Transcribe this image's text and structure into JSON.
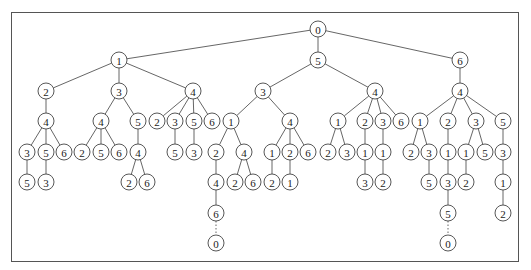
{
  "diagram": {
    "type": "tree",
    "radius": 8,
    "nodes": [
      {
        "id": "r",
        "label": "0",
        "x": 318,
        "y": 29
      },
      {
        "id": "a",
        "label": "1",
        "x": 119,
        "y": 60,
        "parent": "r"
      },
      {
        "id": "b",
        "label": "5",
        "x": 318,
        "y": 60,
        "parent": "r"
      },
      {
        "id": "c",
        "label": "6",
        "x": 460,
        "y": 60,
        "parent": "r"
      },
      {
        "id": "a1",
        "label": "2",
        "x": 46,
        "y": 91,
        "parent": "a"
      },
      {
        "id": "a2",
        "label": "3",
        "x": 119,
        "y": 91,
        "parent": "a"
      },
      {
        "id": "a3",
        "label": "4",
        "x": 193,
        "y": 91,
        "parent": "a"
      },
      {
        "id": "b1",
        "label": "3",
        "x": 263,
        "y": 91,
        "parent": "b"
      },
      {
        "id": "b2",
        "label": "4",
        "x": 375,
        "y": 91,
        "parent": "b"
      },
      {
        "id": "c1",
        "label": "4",
        "x": 460,
        "y": 91,
        "parent": "c"
      },
      {
        "id": "a1a",
        "label": "4",
        "x": 46,
        "y": 121,
        "parent": "a1"
      },
      {
        "id": "a2a",
        "label": "4",
        "x": 101,
        "y": 121,
        "parent": "a2"
      },
      {
        "id": "a2b",
        "label": "5",
        "x": 138,
        "y": 121,
        "parent": "a2"
      },
      {
        "id": "a3a",
        "label": "2",
        "x": 157,
        "y": 121,
        "parent": "a3"
      },
      {
        "id": "a3b",
        "label": "3",
        "x": 175,
        "y": 121,
        "parent": "a3"
      },
      {
        "id": "a3c",
        "label": "5",
        "x": 194,
        "y": 121,
        "parent": "a3"
      },
      {
        "id": "a3d",
        "label": "6",
        "x": 212,
        "y": 121,
        "parent": "a3"
      },
      {
        "id": "b1a",
        "label": "1",
        "x": 231,
        "y": 121,
        "parent": "b1"
      },
      {
        "id": "b1b",
        "label": "4",
        "x": 290,
        "y": 121,
        "parent": "b1"
      },
      {
        "id": "b2a",
        "label": "1",
        "x": 338,
        "y": 121,
        "parent": "b2"
      },
      {
        "id": "b2b",
        "label": "2",
        "x": 365,
        "y": 121,
        "parent": "b2"
      },
      {
        "id": "b2c",
        "label": "3",
        "x": 383,
        "y": 121,
        "parent": "b2"
      },
      {
        "id": "b2d",
        "label": "6",
        "x": 401,
        "y": 121,
        "parent": "b2"
      },
      {
        "id": "c1a",
        "label": "1",
        "x": 420,
        "y": 121,
        "parent": "c1"
      },
      {
        "id": "c1b",
        "label": "2",
        "x": 448,
        "y": 121,
        "parent": "c1"
      },
      {
        "id": "c1c",
        "label": "3",
        "x": 476,
        "y": 121,
        "parent": "c1"
      },
      {
        "id": "c1d",
        "label": "5",
        "x": 503,
        "y": 121,
        "parent": "c1"
      },
      {
        "id": "n1",
        "label": "3",
        "x": 27,
        "y": 152,
        "parent": "a1a"
      },
      {
        "id": "n2",
        "label": "5",
        "x": 46,
        "y": 152,
        "parent": "a1a"
      },
      {
        "id": "n3",
        "label": "6",
        "x": 64,
        "y": 152,
        "parent": "a1a"
      },
      {
        "id": "n4",
        "label": "2",
        "x": 82,
        "y": 152,
        "parent": "a2a"
      },
      {
        "id": "n5",
        "label": "5",
        "x": 101,
        "y": 152,
        "parent": "a2a"
      },
      {
        "id": "n6",
        "label": "6",
        "x": 119,
        "y": 152,
        "parent": "a2a"
      },
      {
        "id": "n7",
        "label": "4",
        "x": 138,
        "y": 152,
        "parent": "a2b"
      },
      {
        "id": "n8",
        "label": "5",
        "x": 175,
        "y": 152,
        "parent": "a3b"
      },
      {
        "id": "n9",
        "label": "3",
        "x": 194,
        "y": 152,
        "parent": "a3c"
      },
      {
        "id": "n10",
        "label": "2",
        "x": 216,
        "y": 152,
        "parent": "b1a"
      },
      {
        "id": "n11",
        "label": "4",
        "x": 244,
        "y": 152,
        "parent": "b1a"
      },
      {
        "id": "n12",
        "label": "1",
        "x": 272,
        "y": 152,
        "parent": "b1b"
      },
      {
        "id": "n13",
        "label": "2",
        "x": 290,
        "y": 152,
        "parent": "b1b"
      },
      {
        "id": "n14",
        "label": "6",
        "x": 308,
        "y": 152,
        "parent": "b1b"
      },
      {
        "id": "n15",
        "label": "2",
        "x": 328,
        "y": 152,
        "parent": "b2a"
      },
      {
        "id": "n16",
        "label": "3",
        "x": 347,
        "y": 152,
        "parent": "b2a"
      },
      {
        "id": "n17",
        "label": "1",
        "x": 365,
        "y": 152,
        "parent": "b2b"
      },
      {
        "id": "n18",
        "label": "1",
        "x": 383,
        "y": 152,
        "parent": "b2c"
      },
      {
        "id": "n19",
        "label": "2",
        "x": 411,
        "y": 152,
        "parent": "c1a"
      },
      {
        "id": "n20",
        "label": "3",
        "x": 429,
        "y": 152,
        "parent": "c1a"
      },
      {
        "id": "n21",
        "label": "1",
        "x": 448,
        "y": 152,
        "parent": "c1b"
      },
      {
        "id": "n22",
        "label": "1",
        "x": 466,
        "y": 152,
        "parent": "c1c"
      },
      {
        "id": "n23",
        "label": "5",
        "x": 485,
        "y": 152,
        "parent": "c1c"
      },
      {
        "id": "n24",
        "label": "3",
        "x": 503,
        "y": 152,
        "parent": "c1d"
      },
      {
        "id": "m1",
        "label": "5",
        "x": 27,
        "y": 182,
        "parent": "n1"
      },
      {
        "id": "m2",
        "label": "3",
        "x": 46,
        "y": 182,
        "parent": "n2"
      },
      {
        "id": "m3",
        "label": "2",
        "x": 129,
        "y": 182,
        "parent": "n7"
      },
      {
        "id": "m4",
        "label": "6",
        "x": 147,
        "y": 182,
        "parent": "n7"
      },
      {
        "id": "m5",
        "label": "4",
        "x": 216,
        "y": 182,
        "parent": "n10"
      },
      {
        "id": "m6",
        "label": "2",
        "x": 235,
        "y": 182,
        "parent": "n11"
      },
      {
        "id": "m7",
        "label": "6",
        "x": 253,
        "y": 182,
        "parent": "n11"
      },
      {
        "id": "m8",
        "label": "2",
        "x": 272,
        "y": 182,
        "parent": "n12"
      },
      {
        "id": "m9",
        "label": "1",
        "x": 290,
        "y": 182,
        "parent": "n13"
      },
      {
        "id": "m10",
        "label": "3",
        "x": 365,
        "y": 182,
        "parent": "n17"
      },
      {
        "id": "m11",
        "label": "2",
        "x": 383,
        "y": 182,
        "parent": "n18"
      },
      {
        "id": "m12",
        "label": "5",
        "x": 429,
        "y": 182,
        "parent": "n20"
      },
      {
        "id": "m13",
        "label": "3",
        "x": 448,
        "y": 182,
        "parent": "n21"
      },
      {
        "id": "m14",
        "label": "2",
        "x": 466,
        "y": 182,
        "parent": "n22"
      },
      {
        "id": "m15",
        "label": "1",
        "x": 503,
        "y": 182,
        "parent": "n24"
      },
      {
        "id": "k1",
        "label": "6",
        "x": 216,
        "y": 213,
        "parent": "m5"
      },
      {
        "id": "k2",
        "label": "5",
        "x": 448,
        "y": 213,
        "parent": "m13"
      },
      {
        "id": "k3",
        "label": "2",
        "x": 503,
        "y": 213,
        "parent": "m15"
      },
      {
        "id": "z1",
        "label": "0",
        "x": 216,
        "y": 243,
        "parent": "k1",
        "dotted": true
      },
      {
        "id": "z2",
        "label": "0",
        "x": 448,
        "y": 243,
        "parent": "k2",
        "dotted": true
      }
    ]
  }
}
